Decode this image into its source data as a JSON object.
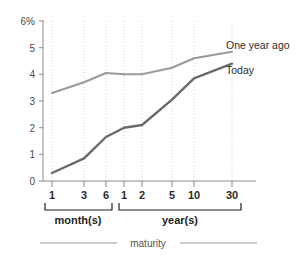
{
  "chart_data": {
    "type": "line",
    "title": "",
    "xlabel": "maturity",
    "ylabel": "",
    "ylim": [
      0,
      6
    ],
    "grid": "vertical-dotted",
    "legend_position": "right-inline",
    "categories": [
      "1",
      "3",
      "6",
      "1",
      "2",
      "5",
      "10",
      "30"
    ],
    "category_groups": [
      {
        "label": "month(s)",
        "members": [
          "1",
          "3",
          "6"
        ]
      },
      {
        "label": "year(s)",
        "members": [
          "1",
          "2",
          "5",
          "10",
          "30"
        ]
      }
    ],
    "y_ticks": [
      "0",
      "1",
      "2",
      "3",
      "4",
      "5",
      "6%"
    ],
    "y_tick_values": [
      0,
      1,
      2,
      3,
      4,
      5,
      6
    ],
    "series": [
      {
        "name": "One year ago",
        "color": "#9a9a9a",
        "values": [
          3.3,
          3.7,
          4.05,
          4.0,
          4.0,
          4.25,
          4.6,
          4.85
        ]
      },
      {
        "name": "Today",
        "color": "#6a6a6a",
        "values": [
          0.3,
          0.85,
          1.65,
          2.0,
          2.1,
          3.05,
          3.85,
          4.4
        ]
      }
    ]
  },
  "axis": {
    "y_ticks": [
      {
        "label": "6%",
        "value": 6
      },
      {
        "label": "5",
        "value": 5
      },
      {
        "label": "4",
        "value": 4
      },
      {
        "label": "3",
        "value": 3
      },
      {
        "label": "2",
        "value": 2
      },
      {
        "label": "1",
        "value": 1
      },
      {
        "label": "0",
        "value": 0
      }
    ],
    "x_ticks": [
      {
        "label": "1"
      },
      {
        "label": "3"
      },
      {
        "label": "6"
      },
      {
        "label": "1"
      },
      {
        "label": "2"
      },
      {
        "label": "5"
      },
      {
        "label": "10"
      },
      {
        "label": "30"
      }
    ],
    "group_month_label": "month(s)",
    "group_year_label": "year(s)",
    "caption": "maturity"
  },
  "legend": {
    "items": [
      {
        "label": "One year ago",
        "color": "#9a9a9a"
      },
      {
        "label": "Today",
        "color": "#6a6a6a"
      }
    ]
  }
}
